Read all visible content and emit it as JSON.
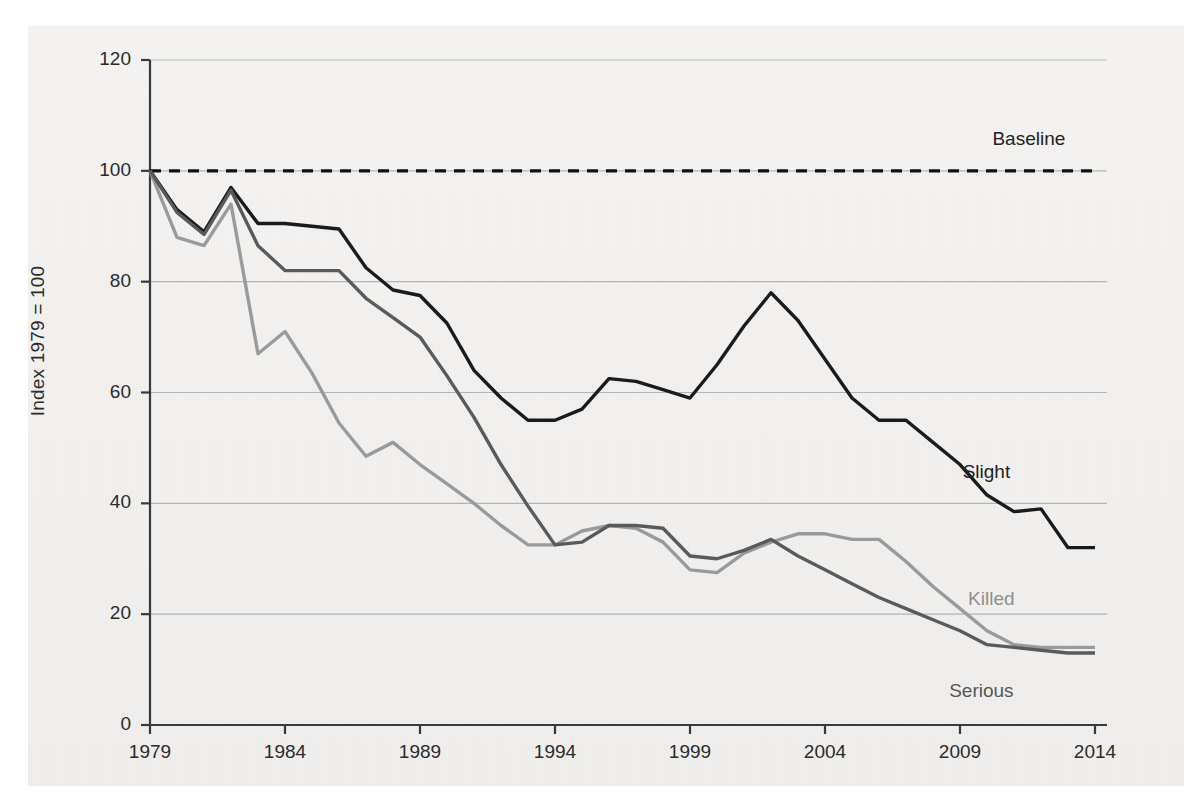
{
  "chart_data": {
    "type": "line",
    "title": "",
    "subtitle": "",
    "xlabel": "",
    "ylabel": "Index 1979 = 100",
    "xlim": [
      1979,
      2014
    ],
    "ylim": [
      0,
      120
    ],
    "grid": "horizontal",
    "legend_position": "inline-right-of-line-ends",
    "x_ticks": [
      "1979",
      "1984",
      "1989",
      "1994",
      "1999",
      "2004",
      "2009",
      "2014"
    ],
    "x_tick_values": [
      1979,
      1984,
      1989,
      1994,
      1999,
      2004,
      2009,
      2014
    ],
    "y_ticks": [
      "0",
      "20",
      "40",
      "60",
      "80",
      "100",
      "120"
    ],
    "y_tick_values": [
      0,
      20,
      40,
      60,
      80,
      100,
      120
    ],
    "x": [
      1979,
      1980,
      1981,
      1982,
      1983,
      1984,
      1985,
      1986,
      1987,
      1988,
      1989,
      1990,
      1991,
      1992,
      1993,
      1994,
      1995,
      1996,
      1997,
      1998,
      1999,
      2000,
      2001,
      2002,
      2003,
      2004,
      2005,
      2006,
      2007,
      2008,
      2009,
      2010,
      2011,
      2012,
      2013,
      2014
    ],
    "series": [
      {
        "name": "Baseline",
        "color": "#111111",
        "style": "dashed",
        "width": 3.4,
        "label_x": 2010.2,
        "label_y": 105.5,
        "values": [
          100,
          100,
          100,
          100,
          100,
          100,
          100,
          100,
          100,
          100,
          100,
          100,
          100,
          100,
          100,
          100,
          100,
          100,
          100,
          100,
          100,
          100,
          100,
          100,
          100,
          100,
          100,
          100,
          100,
          100,
          100,
          100,
          100,
          100,
          100,
          100
        ]
      },
      {
        "name": "Slight",
        "color": "#1b1b1b",
        "style": "solid",
        "width": 3.4,
        "label_x": 2009.1,
        "label_y": 45.5,
        "values": [
          100,
          93,
          89,
          97,
          90.5,
          90.5,
          90,
          89.5,
          82.5,
          78.5,
          77.5,
          72.5,
          64,
          59,
          55,
          55,
          57,
          62.5,
          62,
          60.5,
          59,
          65,
          72,
          78,
          73,
          66,
          59,
          55,
          55,
          51,
          47,
          41.5,
          38.5,
          39,
          32,
          32
        ]
      },
      {
        "name": "Killed",
        "color": "#9a9a9a",
        "style": "solid",
        "width": 3.4,
        "label_x": 2009.3,
        "label_y": 22.5,
        "values": [
          100,
          88,
          86.5,
          94,
          67,
          71,
          63.5,
          54.5,
          48.5,
          51,
          47,
          43.5,
          40,
          36,
          32.5,
          32.5,
          35,
          36,
          35.5,
          33,
          28,
          27.5,
          31,
          33,
          34.5,
          34.5,
          33.5,
          33.5,
          29.5,
          25,
          21,
          17,
          14.5,
          14,
          14,
          14
        ]
      },
      {
        "name": "Serious",
        "color": "#5a5a5a",
        "style": "solid",
        "width": 3.4,
        "label_x": 2008.6,
        "label_y": 6.0,
        "values": [
          100,
          92.5,
          88.5,
          96.5,
          86.5,
          82,
          82,
          82,
          77,
          73.5,
          70,
          63,
          55.5,
          47,
          39.5,
          32.5,
          33,
          36,
          36,
          35.5,
          30.5,
          30,
          31.5,
          33.5,
          30.5,
          28,
          25.5,
          23,
          21,
          19,
          17,
          14.5,
          14,
          13.5,
          13,
          13
        ]
      }
    ]
  }
}
